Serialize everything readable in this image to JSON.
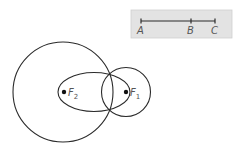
{
  "diagram": {
    "colors": {
      "stroke": "#2b2b2b",
      "label": "#555555",
      "box_fill": "#e3e3e3",
      "box_stroke": "#cfcfcf"
    },
    "segment_box": {
      "points": [
        {
          "label": "A",
          "x": 141
        },
        {
          "label": "B",
          "x": 191
        },
        {
          "label": "C",
          "x": 215
        }
      ]
    },
    "shapes": {
      "large_circle": {
        "cx": 63,
        "cy": 92,
        "r": 50
      },
      "small_circle": {
        "cx": 126,
        "cy": 92,
        "r": 24.5
      },
      "ellipse": {
        "cx": 94,
        "cy": 92,
        "rx": 36,
        "ry": 19.5
      }
    },
    "foci": [
      {
        "name": "F",
        "subscript": "2",
        "x": 64,
        "y": 92
      },
      {
        "name": "F",
        "subscript": "1",
        "x": 126,
        "y": 92
      }
    ]
  }
}
